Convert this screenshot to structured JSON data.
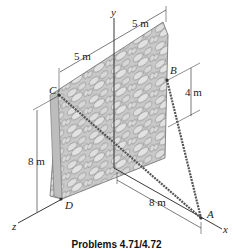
{
  "figure": {
    "caption": "Problems 4.71/4.72",
    "axes": {
      "x": "x",
      "y": "y",
      "z": "z"
    },
    "points": {
      "A": "A",
      "B": "B",
      "C": "C",
      "D": "D"
    },
    "dimensions": {
      "top_left": "5 m",
      "top_right": "5 m",
      "b_height": "4 m",
      "wall_height": "8 m",
      "a_distance": "8 m"
    },
    "colors": {
      "wall_fill": "#c9c9c9",
      "stone_fill": "#dcdcdc",
      "stone_edge": "#7a7a7a",
      "line": "#222222",
      "cable": "#555555"
    }
  }
}
